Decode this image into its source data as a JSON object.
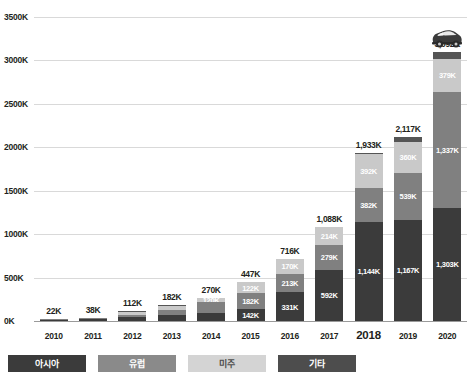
{
  "chart_data": {
    "type": "bar",
    "subtype": "stacked-bar",
    "title": "",
    "subtitle": "",
    "xlabel": "",
    "ylabel": "",
    "ylim": [
      0,
      3500
    ],
    "yunit": "K",
    "grid": true,
    "legend_position": "bottom-left",
    "categories": [
      "2010",
      "2011",
      "2012",
      "2013",
      "2014",
      "2015",
      "2016",
      "2017",
      "2018",
      "2019",
      "2020"
    ],
    "ytick_labels": [
      "0K",
      "500K",
      "1000K",
      "1500K",
      "2000K",
      "2500K",
      "3000K",
      "3500K"
    ],
    "ytick_values": [
      0,
      500,
      1000,
      1500,
      2000,
      2500,
      3000,
      3500
    ],
    "series": [
      {
        "name": "아시아",
        "color": "#3b3b3b",
        "values": [
          13,
          22,
          45,
          70,
          95,
          142,
          331,
          592,
          1144,
          1167,
          1303
        ],
        "labels": [
          "",
          "",
          "",
          "",
          "",
          "142K",
          "331K",
          "592K",
          "1,144K",
          "1,167K",
          "1,303K"
        ]
      },
      {
        "name": "유럽",
        "color": "#808080",
        "values": [
          5,
          9,
          30,
          52,
          120,
          182,
          213,
          279,
          382,
          539,
          1337
        ],
        "labels": [
          "",
          "",
          "",
          "",
          "",
          "182K",
          "213K",
          "279K",
          "382K",
          "539K",
          "1,337K"
        ]
      },
      {
        "name": "미주",
        "color": "#c9c9c9",
        "values": [
          3,
          6,
          34,
          56,
          50,
          122,
          170,
          214,
          392,
          360,
          379
        ],
        "labels": [
          "",
          "",
          "",
          "",
          "120K",
          "122K",
          "170K",
          "214K",
          "392K",
          "360K",
          "379K"
        ]
      },
      {
        "name": "기타",
        "color": "#555555",
        "values": [
          1,
          1,
          3,
          4,
          5,
          1,
          2,
          3,
          15,
          51,
          73
        ],
        "labels": [
          "",
          "",
          "",
          "",
          "",
          "",
          "",
          "",
          "",
          "",
          ""
        ]
      }
    ],
    "totals": [
      22,
      38,
      112,
      182,
      270,
      447,
      716,
      1088,
      1933,
      2117,
      3092
    ],
    "total_labels": [
      "22K",
      "38K",
      "112K",
      "182K",
      "270K",
      "447K",
      "716K",
      "1,088K",
      "1,933K",
      "2,117K",
      "3,092K"
    ],
    "emphasized_category": "2018",
    "annotations": [
      {
        "name": "car-icon",
        "category": "2020",
        "icon": "car-icon"
      }
    ]
  },
  "legend": {
    "items": [
      {
        "label": "아시아",
        "color": "#3b3b3b",
        "text_tone": "dark"
      },
      {
        "label": "유럽",
        "color": "#8a8a8a",
        "text_tone": "dark"
      },
      {
        "label": "미주",
        "color": "#d4d4d4",
        "text_tone": "light"
      },
      {
        "label": "기타",
        "color": "#4d4d4d",
        "text_tone": "dark"
      }
    ]
  },
  "colors": {
    "asia": "#3b3b3b",
    "europe": "#808080",
    "americas": "#c9c9c9",
    "other": "#555555",
    "grid": "#d9d9d9",
    "axis": "#9a9a9a",
    "text": "#231f20",
    "background": "#ffffff"
  }
}
